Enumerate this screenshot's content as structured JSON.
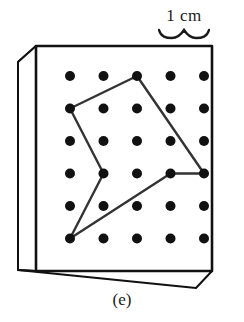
{
  "figure": {
    "caption": "(e)",
    "scale_label": "1 cm",
    "scale_marker_icon": "curly-brace-icon"
  },
  "chart_data": {
    "type": "scatter",
    "title": "(e)",
    "subtitle": "",
    "xlabel": "",
    "ylabel": "",
    "annotations": [
      "1 cm"
    ],
    "grid": false,
    "legend": null,
    "lattice": {
      "columns": 5,
      "rows": 6,
      "spacing_cm": 1,
      "dot_color": "#111111",
      "dot_radius_px": 5,
      "origin_px": [
        70,
        76
      ],
      "step_px": [
        33.5,
        32.5
      ],
      "points": [
        [
          1,
          1
        ],
        [
          2,
          1
        ],
        [
          3,
          1
        ],
        [
          4,
          1
        ],
        [
          5,
          1
        ],
        [
          1,
          2
        ],
        [
          2,
          2
        ],
        [
          3,
          2
        ],
        [
          4,
          2
        ],
        [
          5,
          2
        ],
        [
          1,
          3
        ],
        [
          2,
          3
        ],
        [
          3,
          3
        ],
        [
          4,
          3
        ],
        [
          5,
          3
        ],
        [
          1,
          4
        ],
        [
          2,
          4
        ],
        [
          3,
          4
        ],
        [
          4,
          4
        ],
        [
          5,
          4
        ],
        [
          1,
          5
        ],
        [
          2,
          5
        ],
        [
          3,
          5
        ],
        [
          4,
          5
        ],
        [
          5,
          5
        ],
        [
          1,
          6
        ],
        [
          2,
          6
        ],
        [
          3,
          6
        ],
        [
          4,
          6
        ],
        [
          5,
          6
        ]
      ]
    },
    "polygon": {
      "name": "rubber-band-polygon",
      "closed": true,
      "stroke_color": "#333333",
      "stroke_width_px": 2.4,
      "fill": "none",
      "vertices_grid": [
        [
          3,
          1
        ],
        [
          1,
          2
        ],
        [
          2,
          4
        ],
        [
          1,
          6
        ],
        [
          4,
          4
        ],
        [
          5,
          4
        ]
      ],
      "vertices_px": [
        [
          137,
          76
        ],
        [
          70,
          108.5
        ],
        [
          103.5,
          173.5
        ],
        [
          70,
          238.5
        ],
        [
          170.5,
          173.5
        ],
        [
          204,
          173.5
        ]
      ]
    },
    "box": {
      "name": "geoboard-box",
      "stroke_color": "#111111",
      "face_fill": "#ffffff",
      "front_face_px": [
        [
          36,
          46
        ],
        [
          212,
          46
        ],
        [
          212,
          271
        ],
        [
          36,
          271
        ]
      ],
      "top_face_px": [
        [
          36,
          46
        ],
        [
          18,
          62
        ],
        [
          18,
          66
        ],
        [
          36,
          50
        ]
      ],
      "left_face_px": [
        [
          36,
          46
        ],
        [
          18,
          62
        ],
        [
          18,
          270
        ],
        [
          36,
          271
        ]
      ],
      "bottom_face_px": [
        [
          36,
          271
        ],
        [
          18,
          270
        ],
        [
          196,
          288
        ],
        [
          212,
          271
        ]
      ]
    },
    "scale_bar": {
      "label": "1 cm",
      "left_px": 158,
      "right_px": 210,
      "marker": "curly-brace"
    }
  }
}
